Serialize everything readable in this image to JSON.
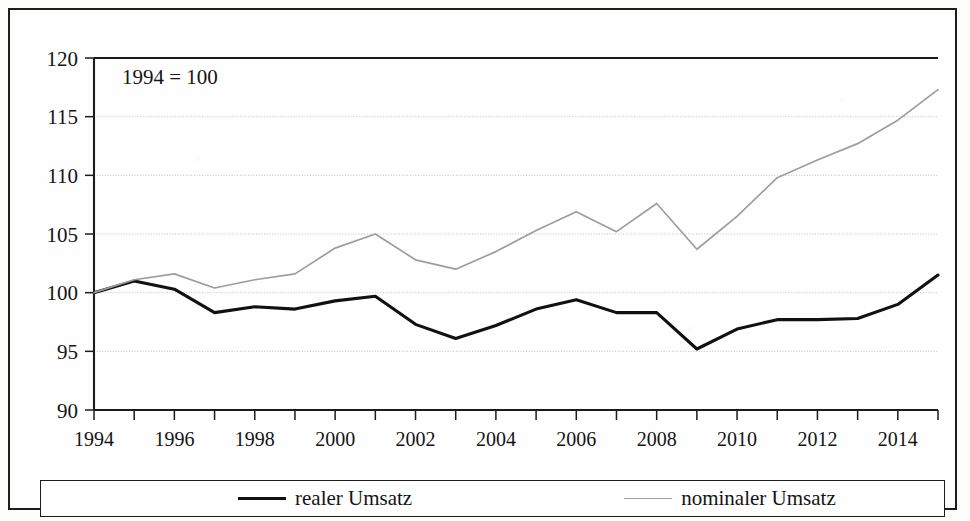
{
  "figure": {
    "annotation": "1994 = 100"
  },
  "legend": {
    "entries": [
      {
        "label": "realer Umsatz",
        "color": "#111111",
        "style": "solid-thick"
      },
      {
        "label": "nominaler Umsatz",
        "color": "#9d9d9d",
        "style": "solid-thin"
      }
    ]
  },
  "chart_data": {
    "type": "line",
    "title": "",
    "subtitle": "",
    "xlabel": "",
    "ylabel": "",
    "annotation": "1994 = 100",
    "grid": true,
    "legend_position": "bottom",
    "xlim": [
      1994,
      2015
    ],
    "ylim": [
      90,
      120
    ],
    "ytick_values": [
      90,
      95,
      100,
      105,
      110,
      115,
      120
    ],
    "ytick_labels": [
      "90",
      "95",
      "100",
      "105",
      "110",
      "115",
      "120"
    ],
    "xtick_labels": [
      "1994",
      "1996",
      "1998",
      "2000",
      "2002",
      "2004",
      "2006",
      "2008",
      "2010",
      "2012",
      "2014"
    ],
    "xtick_values": [
      1994,
      1996,
      1998,
      2000,
      2002,
      2004,
      2006,
      2008,
      2010,
      2012,
      2014
    ],
    "minor_xticks": [
      1994,
      1995,
      1996,
      1997,
      1998,
      1999,
      2000,
      2001,
      2002,
      2003,
      2004,
      2005,
      2006,
      2007,
      2008,
      2009,
      2010,
      2011,
      2012,
      2013,
      2014,
      2015
    ],
    "x": [
      1994,
      1995,
      1996,
      1997,
      1998,
      1999,
      2000,
      2001,
      2002,
      2003,
      2004,
      2005,
      2006,
      2007,
      2008,
      2009,
      2010,
      2011,
      2012,
      2013,
      2014,
      2015
    ],
    "series": [
      {
        "name": "realer Umsatz",
        "color": "#111111",
        "values": [
          100.0,
          101.0,
          100.3,
          98.3,
          98.8,
          98.6,
          99.3,
          99.7,
          97.3,
          96.1,
          97.2,
          98.6,
          99.4,
          98.3,
          98.3,
          95.2,
          96.9,
          97.7,
          97.7,
          97.8,
          99.0,
          101.5
        ]
      },
      {
        "name": "nominaler Umsatz",
        "color": "#9d9d9d",
        "values": [
          100.0,
          101.1,
          101.6,
          100.4,
          101.1,
          101.6,
          103.8,
          105.0,
          102.8,
          102.0,
          103.5,
          105.3,
          106.9,
          105.2,
          107.6,
          103.7,
          106.5,
          109.8,
          111.3,
          112.7,
          114.7,
          117.3
        ]
      }
    ]
  }
}
